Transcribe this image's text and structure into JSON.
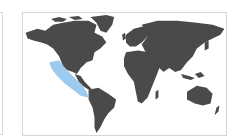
{
  "map": {
    "type": "world-choropleth",
    "land_color": "#4a4a4a",
    "ocean_color": "#ffffff",
    "highlight_color": "#9ccbef",
    "highlighted_region": "Eastern Pacific coast (Mexico / Central America)"
  }
}
